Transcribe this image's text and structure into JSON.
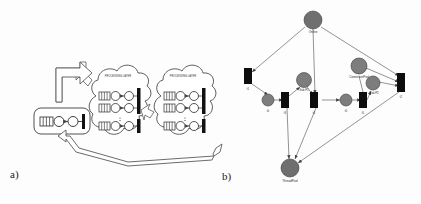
{
  "figure": {
    "panels": [
      {
        "id": "a",
        "label": "a)",
        "caption": "layered architecture with client and server tiers"
      },
      {
        "id": "b",
        "label": "b)",
        "caption": "petri net model"
      }
    ]
  },
  "panel_a": {
    "client_box": {
      "title": "CLIENT"
    },
    "clouds": [
      {
        "title": "PROCESSING LAYER",
        "rows": 3
      },
      {
        "title": "PROCESSING LAYER",
        "rows": 3
      }
    ],
    "element_names": {
      "queue": "queue-icon",
      "place": "place-circle",
      "transition": "transition-bar",
      "block-arrow": "block-arrow"
    }
  },
  "panel_b": {
    "places": [
      {
        "id": "p-online",
        "label": "Online",
        "x": 313,
        "y": 20,
        "r": 9
      },
      {
        "id": "p-t0",
        "label": "t0",
        "x": 268,
        "y": 100,
        "r": 6
      },
      {
        "id": "p-sub-p1",
        "label": "Sub-P1",
        "x": 304,
        "y": 80,
        "r": 7
      },
      {
        "id": "p-t2",
        "label": "t0",
        "x": 346,
        "y": 100,
        "r": 6
      },
      {
        "id": "p-connpool",
        "label": "ConnectionPool",
        "x": 359,
        "y": 68,
        "r": 8
      },
      {
        "id": "p-sub-p2",
        "label": "Sub-P2",
        "x": 372,
        "y": 84,
        "r": 7
      },
      {
        "id": "p-threadpool",
        "label": "ThreadPool",
        "x": 290,
        "y": 168,
        "r": 9
      }
    ],
    "transitions": [
      {
        "id": "tr-t1",
        "label": "t1",
        "x": 248,
        "y": 76,
        "w": 8,
        "h": 16
      },
      {
        "id": "tr-t3",
        "label": "t3",
        "x": 285,
        "y": 100,
        "w": 8,
        "h": 16
      },
      {
        "id": "tr-t4",
        "label": "t4",
        "x": 314,
        "y": 100,
        "w": 8,
        "h": 16
      },
      {
        "id": "tr-t5",
        "label": "t5",
        "x": 363,
        "y": 100,
        "w": 8,
        "h": 16
      },
      {
        "id": "tr-t6",
        "label": "t2",
        "x": 401,
        "y": 82,
        "w": 8,
        "h": 18
      }
    ],
    "colors": {
      "place_fill": "#7d7d7d",
      "transition_fill": "#0d0d0d",
      "edge": "#555555"
    }
  }
}
